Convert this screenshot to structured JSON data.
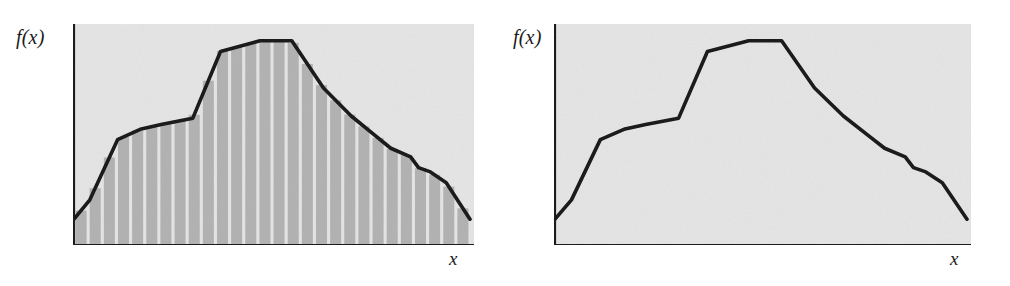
{
  "figure": {
    "caption": "",
    "panels": [
      {
        "id": "left",
        "name": "shaded-riemann-strips",
        "y_axis_label": "f(x)",
        "x_axis_label": "x",
        "shaded": true
      },
      {
        "id": "right",
        "name": "unshaded-curve",
        "y_axis_label": "f(x)",
        "x_axis_label": "x",
        "shaded": false
      }
    ]
  },
  "colors": {
    "background": "#ffffff",
    "panel_background": "#e6e6e6",
    "strip_fill": "#b4b4b4",
    "strip_gap": "#e6e6e6",
    "curve": "#1a1a1a",
    "axis": "#1a1a1a",
    "label_text": "#1b1b1b"
  },
  "chart_data": {
    "type": "area",
    "title": "",
    "xlabel": "x",
    "ylabel": "f(x)",
    "grid": false,
    "legend": null,
    "xlim": [
      0,
      100
    ],
    "ylim": [
      0,
      100
    ],
    "axis_ticks": {
      "x": [],
      "y": []
    },
    "series": [
      {
        "name": "f(x)",
        "points": [
          {
            "x": 0,
            "y": 12
          },
          {
            "x": 4,
            "y": 21
          },
          {
            "x": 11,
            "y": 49
          },
          {
            "x": 17,
            "y": 54
          },
          {
            "x": 22,
            "y": 56
          },
          {
            "x": 30,
            "y": 59
          },
          {
            "x": 37,
            "y": 90
          },
          {
            "x": 47,
            "y": 95
          },
          {
            "x": 55,
            "y": 95
          },
          {
            "x": 63,
            "y": 73
          },
          {
            "x": 70,
            "y": 60
          },
          {
            "x": 76,
            "y": 51
          },
          {
            "x": 80,
            "y": 45
          },
          {
            "x": 85,
            "y": 41
          },
          {
            "x": 87,
            "y": 36
          },
          {
            "x": 90,
            "y": 34
          },
          {
            "x": 94,
            "y": 29
          },
          {
            "x": 100,
            "y": 12
          }
        ]
      }
    ],
    "strips": {
      "count": 28,
      "width_fraction": 0.78,
      "note": "Equal-width vertical rectangles spanning the plot, each reaching the curve height."
    }
  }
}
